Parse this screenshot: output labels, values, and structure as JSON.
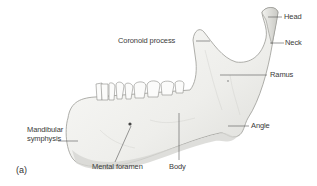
{
  "figure": {
    "panel_label": "(a)",
    "colors": {
      "bone_fill": "#f4f4f2",
      "bone_shade": "#d9d9d5",
      "bone_outline": "#9a9a96",
      "leader_line": "#555555",
      "text": "#3a3a3a"
    },
    "labels": {
      "head": "Head",
      "neck": "Neck",
      "coronoid_process": "Coronoid process",
      "ramus": "Ramus",
      "angle": "Angle",
      "body": "Body",
      "mental_foramen": "Mental foramen",
      "mandibular_symphysis_line1": "Mandibular",
      "mandibular_symphysis_line2": "symphysis"
    }
  }
}
